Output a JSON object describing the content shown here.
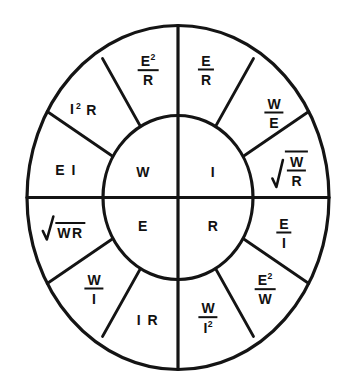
{
  "diagram": {
    "type": "ohms-law-power-wheel",
    "background_color": "#ffffff",
    "line_color": "#141414",
    "text_color": "#111111",
    "inner_quadrants": [
      {
        "id": "power",
        "symbol": "W",
        "position": "top-left"
      },
      {
        "id": "current",
        "symbol": "I",
        "position": "top-right"
      },
      {
        "id": "voltage",
        "symbol": "E",
        "position": "bottom-left"
      },
      {
        "id": "resistance",
        "symbol": "R",
        "position": "bottom-right"
      }
    ],
    "outer_sectors": [
      {
        "id": "s1",
        "quadrant": "I",
        "solves_for": "I",
        "formula": "E/R",
        "render": "fraction",
        "num": "E",
        "den": "R",
        "num_sup": "",
        "den_sup": ""
      },
      {
        "id": "s2",
        "quadrant": "I",
        "solves_for": "I",
        "formula": "W/E",
        "render": "fraction",
        "num": "W",
        "den": "E",
        "num_sup": "",
        "den_sup": ""
      },
      {
        "id": "s3",
        "quadrant": "I",
        "solves_for": "I",
        "formula": "sqrt(W/R)",
        "render": "radical-fraction",
        "num": "W",
        "den": "R"
      },
      {
        "id": "s4",
        "quadrant": "R",
        "solves_for": "R",
        "formula": "E/I",
        "render": "fraction",
        "num": "E",
        "den": "I",
        "num_sup": "",
        "den_sup": ""
      },
      {
        "id": "s5",
        "quadrant": "R",
        "solves_for": "R",
        "formula": "E^2/W",
        "render": "fraction",
        "num": "E",
        "den": "W",
        "num_sup": "2",
        "den_sup": ""
      },
      {
        "id": "s6",
        "quadrant": "R",
        "solves_for": "R",
        "formula": "W/I^2",
        "render": "fraction",
        "num": "W",
        "den": "I",
        "num_sup": "",
        "den_sup": "2"
      },
      {
        "id": "s7",
        "quadrant": "E",
        "solves_for": "E",
        "formula": "I R",
        "render": "term",
        "text": "I R"
      },
      {
        "id": "s8",
        "quadrant": "E",
        "solves_for": "E",
        "formula": "W/I",
        "render": "fraction",
        "num": "W",
        "den": "I",
        "num_sup": "",
        "den_sup": ""
      },
      {
        "id": "s9",
        "quadrant": "E",
        "solves_for": "E",
        "formula": "sqrt(WR)",
        "render": "radical-term",
        "text": "WR"
      },
      {
        "id": "s10",
        "quadrant": "W",
        "solves_for": "W",
        "formula": "E I",
        "render": "term",
        "text": "E I"
      },
      {
        "id": "s11",
        "quadrant": "W",
        "solves_for": "W",
        "formula": "I^2 R",
        "render": "term-sup",
        "base": "I",
        "sup": "2",
        "tail": "R"
      },
      {
        "id": "s12",
        "quadrant": "W",
        "solves_for": "W",
        "formula": "E^2/R",
        "render": "fraction",
        "num": "E",
        "den": "R",
        "num_sup": "2",
        "den_sup": ""
      }
    ]
  }
}
